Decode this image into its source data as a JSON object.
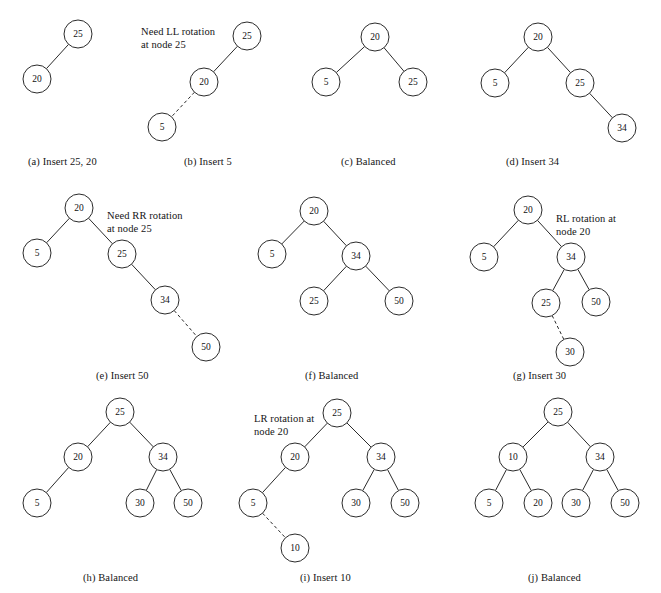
{
  "figure": {
    "width": 661,
    "height": 593,
    "background": "#ffffff",
    "stroke_color": "#2b2b2b",
    "text_color": "#141414",
    "node_radius": 14
  },
  "panels": [
    {
      "id": "a",
      "caption": "(a) Insert 25, 20",
      "caption_x": 28,
      "caption_y": 156,
      "annotation": null,
      "nodes": [
        {
          "key": "n25",
          "label": "25",
          "x": 78,
          "y": 34
        },
        {
          "key": "n20",
          "label": "20",
          "x": 37,
          "y": 79
        }
      ],
      "edges": [
        {
          "from": "n25",
          "to": "n20",
          "dashed": false
        }
      ]
    },
    {
      "id": "b",
      "caption": "(b) Insert 5",
      "caption_x": 184,
      "caption_y": 156,
      "annotation": {
        "text": "Need LL rotation\nat node 25",
        "x": 141,
        "y": 26
      },
      "nodes": [
        {
          "key": "n25",
          "label": "25",
          "x": 247,
          "y": 36
        },
        {
          "key": "n20",
          "label": "20",
          "x": 204,
          "y": 82
        },
        {
          "key": "n5",
          "label": "5",
          "x": 162,
          "y": 127
        }
      ],
      "edges": [
        {
          "from": "n25",
          "to": "n20",
          "dashed": false
        },
        {
          "from": "n20",
          "to": "n5",
          "dashed": true
        }
      ]
    },
    {
      "id": "c",
      "caption": "(c) Balanced",
      "caption_x": 341,
      "caption_y": 156,
      "annotation": null,
      "nodes": [
        {
          "key": "n20",
          "label": "20",
          "x": 375,
          "y": 37
        },
        {
          "key": "n5",
          "label": "5",
          "x": 326,
          "y": 82
        },
        {
          "key": "n25",
          "label": "25",
          "x": 413,
          "y": 82
        }
      ],
      "edges": [
        {
          "from": "n20",
          "to": "n5",
          "dashed": false
        },
        {
          "from": "n20",
          "to": "n25",
          "dashed": false
        }
      ]
    },
    {
      "id": "d",
      "caption": "(d) Insert 34",
      "caption_x": 506,
      "caption_y": 156,
      "annotation": null,
      "nodes": [
        {
          "key": "n20",
          "label": "20",
          "x": 538,
          "y": 37
        },
        {
          "key": "n5",
          "label": "5",
          "x": 495,
          "y": 83
        },
        {
          "key": "n25",
          "label": "25",
          "x": 580,
          "y": 83
        },
        {
          "key": "n34",
          "label": "34",
          "x": 622,
          "y": 128
        }
      ],
      "edges": [
        {
          "from": "n20",
          "to": "n5",
          "dashed": false
        },
        {
          "from": "n20",
          "to": "n25",
          "dashed": false
        },
        {
          "from": "n25",
          "to": "n34",
          "dashed": false
        }
      ]
    },
    {
      "id": "e",
      "caption": "(e) Insert 50",
      "caption_x": 96,
      "caption_y": 370,
      "annotation": {
        "text": "Need RR rotation\nat node 25",
        "x": 107,
        "y": 210
      },
      "nodes": [
        {
          "key": "n20",
          "label": "20",
          "x": 79,
          "y": 208
        },
        {
          "key": "n5",
          "label": "5",
          "x": 37,
          "y": 253
        },
        {
          "key": "n25",
          "label": "25",
          "x": 122,
          "y": 254
        },
        {
          "key": "n34",
          "label": "34",
          "x": 165,
          "y": 300
        },
        {
          "key": "n50",
          "label": "50",
          "x": 206,
          "y": 347
        }
      ],
      "edges": [
        {
          "from": "n20",
          "to": "n5",
          "dashed": false
        },
        {
          "from": "n20",
          "to": "n25",
          "dashed": false
        },
        {
          "from": "n25",
          "to": "n34",
          "dashed": false
        },
        {
          "from": "n34",
          "to": "n50",
          "dashed": true
        }
      ]
    },
    {
      "id": "f",
      "caption": "(f) Balanced",
      "caption_x": 305,
      "caption_y": 370,
      "annotation": null,
      "nodes": [
        {
          "key": "n20",
          "label": "20",
          "x": 314,
          "y": 211
        },
        {
          "key": "n5",
          "label": "5",
          "x": 272,
          "y": 254
        },
        {
          "key": "n34",
          "label": "34",
          "x": 356,
          "y": 256
        },
        {
          "key": "n25",
          "label": "25",
          "x": 314,
          "y": 301
        },
        {
          "key": "n50",
          "label": "50",
          "x": 399,
          "y": 301
        }
      ],
      "edges": [
        {
          "from": "n20",
          "to": "n5",
          "dashed": false
        },
        {
          "from": "n20",
          "to": "n34",
          "dashed": false
        },
        {
          "from": "n34",
          "to": "n25",
          "dashed": false
        },
        {
          "from": "n34",
          "to": "n50",
          "dashed": false
        }
      ]
    },
    {
      "id": "g",
      "caption": "(g) Insert 30",
      "caption_x": 513,
      "caption_y": 370,
      "annotation": {
        "text": "RL rotation at\nnode 20",
        "x": 556,
        "y": 213
      },
      "nodes": [
        {
          "key": "n20",
          "label": "20",
          "x": 528,
          "y": 210
        },
        {
          "key": "n5",
          "label": "5",
          "x": 484,
          "y": 257
        },
        {
          "key": "n34",
          "label": "34",
          "x": 571,
          "y": 257
        },
        {
          "key": "n25",
          "label": "25",
          "x": 546,
          "y": 303
        },
        {
          "key": "n50",
          "label": "50",
          "x": 596,
          "y": 302
        },
        {
          "key": "n30",
          "label": "30",
          "x": 570,
          "y": 352
        }
      ],
      "edges": [
        {
          "from": "n20",
          "to": "n5",
          "dashed": false
        },
        {
          "from": "n20",
          "to": "n34",
          "dashed": false
        },
        {
          "from": "n34",
          "to": "n25",
          "dashed": false
        },
        {
          "from": "n34",
          "to": "n50",
          "dashed": false
        },
        {
          "from": "n25",
          "to": "n30",
          "dashed": true
        }
      ]
    },
    {
      "id": "h",
      "caption": "(h) Balanced",
      "caption_x": 83,
      "caption_y": 572,
      "annotation": null,
      "nodes": [
        {
          "key": "n25",
          "label": "25",
          "x": 120,
          "y": 412
        },
        {
          "key": "n20",
          "label": "20",
          "x": 78,
          "y": 457
        },
        {
          "key": "n34",
          "label": "34",
          "x": 163,
          "y": 457
        },
        {
          "key": "n5",
          "label": "5",
          "x": 37,
          "y": 503
        },
        {
          "key": "n30",
          "label": "30",
          "x": 140,
          "y": 503
        },
        {
          "key": "n50",
          "label": "50",
          "x": 188,
          "y": 503
        }
      ],
      "edges": [
        {
          "from": "n25",
          "to": "n20",
          "dashed": false
        },
        {
          "from": "n25",
          "to": "n34",
          "dashed": false
        },
        {
          "from": "n20",
          "to": "n5",
          "dashed": false
        },
        {
          "from": "n34",
          "to": "n30",
          "dashed": false
        },
        {
          "from": "n34",
          "to": "n50",
          "dashed": false
        }
      ]
    },
    {
      "id": "i",
      "caption": "(i) Insert 10",
      "caption_x": 300,
      "caption_y": 572,
      "annotation": {
        "text": "LR rotation at\nnode 20",
        "x": 254,
        "y": 413
      },
      "nodes": [
        {
          "key": "n25",
          "label": "25",
          "x": 337,
          "y": 413
        },
        {
          "key": "n20",
          "label": "20",
          "x": 295,
          "y": 457
        },
        {
          "key": "n34",
          "label": "34",
          "x": 381,
          "y": 457
        },
        {
          "key": "n5",
          "label": "5",
          "x": 253,
          "y": 503
        },
        {
          "key": "n30",
          "label": "30",
          "x": 356,
          "y": 503
        },
        {
          "key": "n50",
          "label": "50",
          "x": 405,
          "y": 503
        },
        {
          "key": "n10",
          "label": "10",
          "x": 295,
          "y": 548
        }
      ],
      "edges": [
        {
          "from": "n25",
          "to": "n20",
          "dashed": false
        },
        {
          "from": "n25",
          "to": "n34",
          "dashed": false
        },
        {
          "from": "n20",
          "to": "n5",
          "dashed": false
        },
        {
          "from": "n34",
          "to": "n30",
          "dashed": false
        },
        {
          "from": "n34",
          "to": "n50",
          "dashed": false
        },
        {
          "from": "n5",
          "to": "n10",
          "dashed": true
        }
      ]
    },
    {
      "id": "j",
      "caption": "(j) Balanced",
      "caption_x": 528,
      "caption_y": 572,
      "annotation": null,
      "nodes": [
        {
          "key": "n25",
          "label": "25",
          "x": 558,
          "y": 412
        },
        {
          "key": "n10",
          "label": "10",
          "x": 513,
          "y": 457
        },
        {
          "key": "n34",
          "label": "34",
          "x": 600,
          "y": 457
        },
        {
          "key": "n5",
          "label": "5",
          "x": 489,
          "y": 503
        },
        {
          "key": "n20",
          "label": "20",
          "x": 538,
          "y": 503
        },
        {
          "key": "n30",
          "label": "30",
          "x": 576,
          "y": 503
        },
        {
          "key": "n50",
          "label": "50",
          "x": 625,
          "y": 503
        }
      ],
      "edges": [
        {
          "from": "n25",
          "to": "n10",
          "dashed": false
        },
        {
          "from": "n25",
          "to": "n34",
          "dashed": false
        },
        {
          "from": "n10",
          "to": "n5",
          "dashed": false
        },
        {
          "from": "n10",
          "to": "n20",
          "dashed": false
        },
        {
          "from": "n34",
          "to": "n30",
          "dashed": false
        },
        {
          "from": "n34",
          "to": "n50",
          "dashed": false
        }
      ]
    }
  ]
}
